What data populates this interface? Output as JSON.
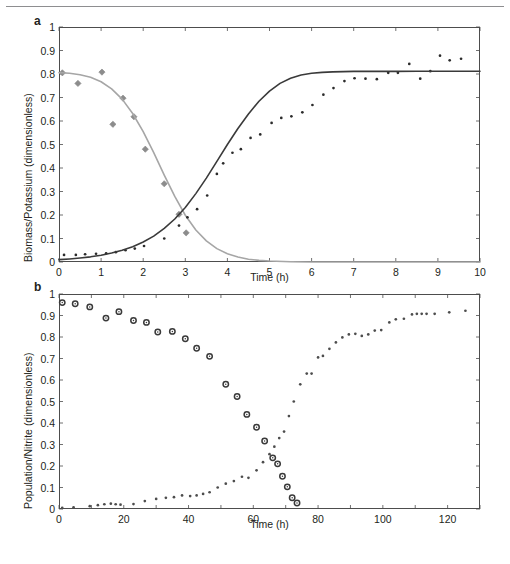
{
  "figure": {
    "panels": [
      {
        "letter": "a"
      },
      {
        "letter": "b"
      }
    ]
  },
  "chart_data": [
    {
      "type": "scatter",
      "panel": "a",
      "title": "",
      "xlabel": "Time (h)",
      "ylabel": "Biomass/Potassium (dimensionless)",
      "xlim": [
        0,
        10
      ],
      "ylim": [
        0,
        1
      ],
      "xticks": [
        0,
        1,
        2,
        3,
        4,
        5,
        6,
        7,
        8,
        9,
        10
      ],
      "xticklabels": [
        "0",
        "1",
        "2",
        "3",
        "4",
        "5",
        "6",
        "7",
        "8",
        "9",
        "10"
      ],
      "yticks": [
        0,
        0.1,
        0.2,
        0.3,
        0.4,
        0.5,
        0.6,
        0.7,
        0.8,
        0.9,
        1
      ],
      "yticklabels": [
        "0",
        "0.1",
        "0.2",
        "0.3",
        "0.4",
        "0.5",
        "0.6",
        "0.7",
        "0.8",
        "0.9",
        "1"
      ],
      "grid": false,
      "legend": "none",
      "series": [
        {
          "name": "Potassium (data)",
          "marker": "diamond",
          "color": "#8c8c8c",
          "x": [
            0.08,
            0.45,
            1.02,
            1.28,
            1.52,
            1.78,
            2.05,
            2.5,
            2.85,
            3.02
          ],
          "y": [
            0.805,
            0.76,
            0.808,
            0.586,
            0.697,
            0.618,
            0.48,
            0.333,
            0.203,
            0.124
          ]
        },
        {
          "name": "Potassium (model)",
          "marker": "line",
          "color": "#a6a6a6",
          "x": [
            0.0,
            0.25,
            0.5,
            0.75,
            1.0,
            1.25,
            1.5,
            1.75,
            2.0,
            2.25,
            2.5,
            2.75,
            3.0,
            3.25,
            3.5,
            3.75,
            4.0,
            4.25,
            4.5,
            4.75,
            5.0,
            5.5,
            6.0,
            7.0,
            8.0,
            9.0,
            10.0
          ],
          "y": [
            0.806,
            0.803,
            0.797,
            0.786,
            0.767,
            0.737,
            0.693,
            0.632,
            0.555,
            0.465,
            0.37,
            0.279,
            0.199,
            0.136,
            0.09,
            0.057,
            0.035,
            0.021,
            0.012,
            0.007,
            0.004,
            0.001,
            0.0,
            0.0,
            0.0,
            0.0,
            0.0
          ]
        },
        {
          "name": "Biomass (data)",
          "marker": "dot",
          "color": "#2b2b2b",
          "x": [
            0.12,
            0.4,
            0.62,
            0.88,
            1.12,
            1.35,
            1.58,
            1.8,
            2.02,
            2.5,
            2.85,
            3.05,
            3.28,
            3.52,
            3.75,
            3.9,
            4.12,
            4.32,
            4.55,
            4.78,
            5.05,
            5.28,
            5.52,
            5.78,
            6.02,
            6.28,
            6.52,
            6.78,
            7.02,
            7.28,
            7.55,
            7.82,
            8.05,
            8.32,
            8.58,
            8.82,
            9.05,
            9.28,
            9.55
          ],
          "y": [
            0.03,
            0.03,
            0.033,
            0.035,
            0.037,
            0.042,
            0.05,
            0.057,
            0.068,
            0.1,
            0.155,
            0.19,
            0.225,
            0.283,
            0.375,
            0.42,
            0.465,
            0.48,
            0.528,
            0.543,
            0.592,
            0.613,
            0.62,
            0.637,
            0.668,
            0.712,
            0.74,
            0.77,
            0.782,
            0.78,
            0.778,
            0.805,
            0.805,
            0.843,
            0.78,
            0.812,
            0.878,
            0.858,
            0.865
          ]
        },
        {
          "name": "Biomass (model)",
          "marker": "line",
          "color": "#3a3a3a",
          "x": [
            0.0,
            0.25,
            0.5,
            0.75,
            1.0,
            1.25,
            1.5,
            1.75,
            2.0,
            2.25,
            2.5,
            2.75,
            3.0,
            3.25,
            3.5,
            3.75,
            4.0,
            4.25,
            4.5,
            4.75,
            5.0,
            5.25,
            5.5,
            5.75,
            6.0,
            6.25,
            6.5,
            6.75,
            7.0,
            7.25,
            7.5,
            8.0,
            8.5,
            9.0,
            9.5,
            10.0
          ],
          "y": [
            0.01,
            0.013,
            0.017,
            0.022,
            0.029,
            0.038,
            0.05,
            0.065,
            0.085,
            0.11,
            0.143,
            0.183,
            0.232,
            0.291,
            0.357,
            0.428,
            0.5,
            0.568,
            0.63,
            0.684,
            0.727,
            0.76,
            0.782,
            0.796,
            0.803,
            0.807,
            0.809,
            0.81,
            0.811,
            0.811,
            0.811,
            0.811,
            0.812,
            0.812,
            0.812,
            0.812
          ]
        }
      ]
    },
    {
      "type": "scatter",
      "panel": "b",
      "title": "",
      "xlabel": "Time (h)",
      "ylabel": "Population/Nitrite (dimensionless)",
      "xlim": [
        0,
        130
      ],
      "ylim": [
        0,
        1
      ],
      "xticks": [
        0,
        20,
        40,
        60,
        80,
        100,
        120
      ],
      "xticklabels": [
        "0",
        "20",
        "40",
        "60",
        "80",
        "100",
        "120"
      ],
      "yticks": [
        0,
        0.1,
        0.2,
        0.3,
        0.4,
        0.5,
        0.6,
        0.7,
        0.8,
        0.9,
        1
      ],
      "yticklabels": [
        "0",
        "0.1",
        "0.2",
        "0.3",
        "0.4",
        "0.5",
        "0.6",
        "0.7",
        "0.8",
        "0.9",
        "1"
      ],
      "grid": false,
      "legend": "none",
      "series": [
        {
          "name": "Nitrite (data)",
          "marker": "circle",
          "color": "#3a3a3a",
          "x": [
            1,
            5,
            9.5,
            14.5,
            18.5,
            23,
            27,
            30.5,
            35,
            39,
            42.5,
            46.5,
            51.5,
            55,
            58,
            61,
            63.5,
            66,
            67.5,
            69,
            70.5,
            72,
            73.5
          ],
          "y": [
            0.96,
            0.955,
            0.94,
            0.888,
            0.918,
            0.877,
            0.868,
            0.823,
            0.826,
            0.792,
            0.748,
            0.71,
            0.58,
            0.523,
            0.44,
            0.38,
            0.316,
            0.238,
            0.21,
            0.152,
            0.103,
            0.052,
            0.028
          ]
        },
        {
          "name": "Population (data)",
          "marker": "dot",
          "color": "#4d4d4d",
          "x": [
            1,
            4.5,
            9.5,
            12,
            14,
            16,
            17.5,
            19,
            23,
            26.5,
            30,
            33,
            35.5,
            38,
            40.5,
            42.5,
            44.5,
            46.5,
            49,
            51.5,
            54,
            56.5,
            58.5,
            61,
            63,
            65,
            66.5,
            68,
            69.5,
            71,
            72.5,
            74.5,
            76.5,
            78,
            80,
            81.5,
            83.5,
            85.5,
            87.5,
            89.5,
            91.5,
            93.5,
            95.5,
            97.5,
            99.5,
            102,
            104,
            106.5,
            109,
            110.5,
            112,
            113.5,
            116,
            120.5,
            125.5
          ],
          "y": [
            0.005,
            0.008,
            0.013,
            0.018,
            0.022,
            0.025,
            0.022,
            0.02,
            0.023,
            0.037,
            0.047,
            0.052,
            0.055,
            0.063,
            0.06,
            0.063,
            0.07,
            0.078,
            0.1,
            0.118,
            0.13,
            0.15,
            0.145,
            0.18,
            0.218,
            0.255,
            0.29,
            0.33,
            0.36,
            0.432,
            0.5,
            0.58,
            0.63,
            0.63,
            0.705,
            0.712,
            0.745,
            0.775,
            0.798,
            0.812,
            0.815,
            0.805,
            0.812,
            0.83,
            0.832,
            0.868,
            0.882,
            0.885,
            0.905,
            0.908,
            0.908,
            0.908,
            0.908,
            0.915,
            0.922
          ]
        }
      ]
    }
  ]
}
